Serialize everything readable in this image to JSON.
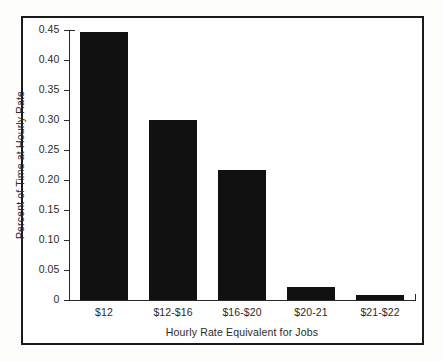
{
  "figure": {
    "background_color": "#fefefe",
    "frame_color": "#1a1a1a",
    "bar_color": "#111111",
    "axis_color": "#2b2b2b"
  },
  "chart_data": {
    "type": "bar",
    "title": "",
    "subtitle": "",
    "xlabel": "Hourly Rate Equivalent for Jobs",
    "ylabel": "Percent of Time at Hourly Rate",
    "categories": [
      "$12",
      "$12-$16",
      "$16-$20",
      "$20-21",
      "$21-$22"
    ],
    "values": [
      0.446,
      0.3,
      0.216,
      0.021,
      0.008
    ],
    "ylim": [
      0,
      0.45
    ],
    "yticks": [
      0,
      0.05,
      0.1,
      0.15,
      0.2,
      0.25,
      0.3,
      0.35,
      0.4,
      0.45
    ],
    "ytick_labels": [
      "0",
      "0.05",
      "0.10",
      "0.15",
      "0.20",
      "0.25",
      "0.30",
      "0.35",
      "0.40",
      "0.45"
    ],
    "grid": false,
    "legend": null,
    "legend_position": "none",
    "annotations": [],
    "series": [
      {
        "name": "Percent of Time at Hourly Rate",
        "values": [
          0.446,
          0.3,
          0.216,
          0.021,
          0.008
        ]
      }
    ]
  }
}
